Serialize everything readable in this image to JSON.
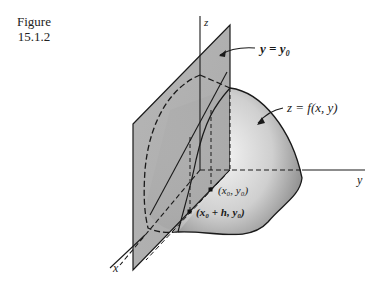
{
  "figure": {
    "caption_word": "Figure",
    "caption_number": "15.1.2"
  },
  "axes": {
    "x_label": "x",
    "y_label": "y",
    "z_label": "z"
  },
  "annotations": {
    "plane_label": "y = y₀",
    "surface_label": "z = f(x, y)",
    "point_1": "(x₀, y₀)",
    "point_2": "(x₀ + h, y₀)"
  },
  "colors": {
    "plane_fill": "#a8a8a8",
    "surface_light": "#f2f2f2",
    "surface_dark": "#8a8a8a",
    "line": "#1a1a1a"
  }
}
